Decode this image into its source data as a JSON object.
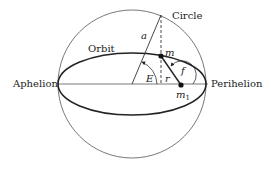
{
  "diagram": {
    "labels": {
      "circle": "Circle",
      "orbit": "Orbit",
      "aphelion": "Aphelion",
      "perihelion": "Perihelion",
      "a": "a",
      "m": "m",
      "m1_base": "m",
      "m1_sub": "1",
      "E": "E",
      "r": "r",
      "f": "f"
    },
    "geometry": {
      "circle": {
        "cx": 132,
        "cy": 84,
        "r": 74
      },
      "ellipse": {
        "cx": 132,
        "cy": 84,
        "rx": 74,
        "ry": 31
      },
      "point_m": {
        "x": 161,
        "y": 56
      },
      "point_m1": {
        "x": 181,
        "y": 85
      }
    },
    "colors": {
      "line": "#222222",
      "thin_line": "#555555",
      "background": "#ffffff"
    }
  }
}
